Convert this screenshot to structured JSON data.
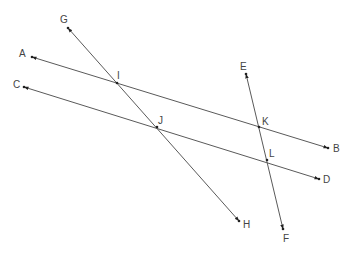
{
  "diagram": {
    "title": "",
    "colors": {
      "line": "#5a5a5a",
      "point": "#222222",
      "label": "#444444",
      "background": "#ffffff"
    },
    "points": {
      "A": {
        "label": "A",
        "x": 32,
        "y": 57,
        "lx": 19,
        "ly": 57
      },
      "B": {
        "label": "B",
        "x": 328,
        "y": 148,
        "lx": 333,
        "ly": 152
      },
      "C": {
        "label": "C",
        "x": 24,
        "y": 87,
        "lx": 13,
        "ly": 88
      },
      "D": {
        "label": "D",
        "x": 319,
        "y": 179,
        "lx": 323,
        "ly": 183
      },
      "E": {
        "label": "E",
        "x": 246,
        "y": 74,
        "lx": 240,
        "ly": 70
      },
      "F": {
        "label": "F",
        "x": 283,
        "y": 229,
        "lx": 283,
        "ly": 242
      },
      "G": {
        "label": "G",
        "x": 68,
        "y": 28,
        "lx": 60,
        "ly": 23
      },
      "H": {
        "label": "H",
        "x": 239,
        "y": 221,
        "lx": 243,
        "ly": 228
      },
      "I": {
        "label": "I",
        "x": 117,
        "y": 83,
        "lx": 117,
        "ly": 79
      },
      "J": {
        "label": "J",
        "x": 157,
        "y": 127,
        "lx": 158,
        "ly": 124
      },
      "K": {
        "label": "K",
        "x": 259,
        "y": 127,
        "lx": 262,
        "ly": 125
      },
      "L": {
        "label": "L",
        "x": 267,
        "y": 160,
        "lx": 269,
        "ly": 157
      }
    },
    "lines": [
      {
        "name": "AB",
        "from": "A",
        "to": "B",
        "type": "line",
        "arrows": "both"
      },
      {
        "name": "CD",
        "from": "C",
        "to": "D",
        "type": "line",
        "arrows": "both"
      },
      {
        "name": "GH",
        "from": "G",
        "to": "H",
        "type": "line",
        "arrows": "both"
      },
      {
        "name": "EF",
        "from": "E",
        "to": "F",
        "type": "line",
        "arrows": "both"
      }
    ],
    "intersections": [
      {
        "point": "I",
        "lines": [
          "AB",
          "GH"
        ]
      },
      {
        "point": "J",
        "lines": [
          "CD",
          "GH"
        ]
      },
      {
        "point": "K",
        "lines": [
          "AB",
          "EF"
        ]
      },
      {
        "point": "L",
        "lines": [
          "CD",
          "EF"
        ]
      }
    ]
  }
}
